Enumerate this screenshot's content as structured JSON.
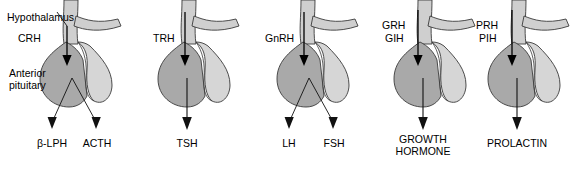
{
  "figure": {
    "title": "",
    "annotations": {
      "hypothalamus": "Hypothalamus",
      "anterior_pituitary_line1": "Anterior",
      "anterior_pituitary_line2": "pituitary"
    },
    "colors": {
      "anterior_lobe": "#a9a9a9",
      "posterior_lobe": "#d6d6d6",
      "stalk": "#cfcfcf",
      "outline": "#3a3a3a",
      "arrow": "#000000",
      "background": "#ffffff"
    }
  },
  "panels": [
    {
      "id": "panel-crh",
      "releasing_factors": [
        "CRH"
      ],
      "outputs": [
        "β-LPH",
        "ACTH"
      ],
      "output_count": 2,
      "output_style": "split"
    },
    {
      "id": "panel-trh",
      "releasing_factors": [
        "TRH"
      ],
      "outputs": [
        "TSH"
      ],
      "output_count": 1,
      "output_style": "single"
    },
    {
      "id": "panel-gnrh",
      "releasing_factors": [
        "GnRH"
      ],
      "outputs": [
        "LH",
        "FSH"
      ],
      "output_count": 2,
      "output_style": "split"
    },
    {
      "id": "panel-grh-gih",
      "releasing_factors": [
        "GRH",
        "GIH"
      ],
      "outputs": [
        "GROWTH\nHORMONE"
      ],
      "output_lines": [
        "GROWTH",
        "HORMONE"
      ],
      "output_count": 1,
      "output_style": "single"
    },
    {
      "id": "panel-prh-pih",
      "releasing_factors": [
        "PRH",
        "PIH"
      ],
      "outputs": [
        "PROLACTIN"
      ],
      "output_count": 1,
      "output_style": "single"
    }
  ]
}
